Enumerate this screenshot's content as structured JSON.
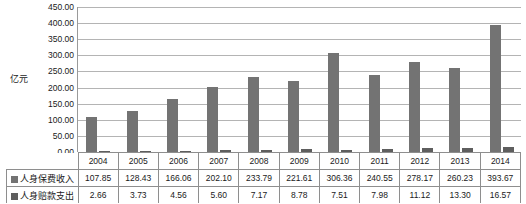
{
  "chart_data": {
    "type": "bar",
    "title": "",
    "xlabel": "",
    "ylabel": "亿元",
    "ylim": [
      0,
      450
    ],
    "ytick_step": 50,
    "ytick_labels": [
      "450.00",
      "400.00",
      "350.00",
      "300.00",
      "250.00",
      "200.00",
      "150.00",
      "100.00",
      "50.00",
      "0.00"
    ],
    "ytick_values": [
      450,
      400,
      350,
      300,
      250,
      200,
      150,
      100,
      50,
      0
    ],
    "grid": true,
    "legend_position": "table-left",
    "categories": [
      "2004",
      "2005",
      "2006",
      "2007",
      "2008",
      "2009",
      "2010",
      "2011",
      "2012",
      "2013",
      "2014"
    ],
    "series": [
      {
        "name": "人身保费收入",
        "color": "#737373",
        "values": [
          107.85,
          128.43,
          166.06,
          202.1,
          233.79,
          221.61,
          306.36,
          240.55,
          278.17,
          260.23,
          393.67
        ],
        "labels": [
          "107.85",
          "128.43",
          "166.06",
          "202.10",
          "233.79",
          "221.61",
          "306.36",
          "240.55",
          "278.17",
          "260.23",
          "393.67"
        ]
      },
      {
        "name": "人身赔款支出",
        "color": "#5e5e5e",
        "values": [
          2.66,
          3.73,
          4.56,
          5.6,
          7.17,
          8.78,
          7.51,
          7.98,
          11.12,
          13.3,
          16.57
        ],
        "labels": [
          "2.66",
          "3.73",
          "4.56",
          "5.60",
          "7.17",
          "8.78",
          "7.51",
          "7.98",
          "11.12",
          "13.30",
          "16.57"
        ]
      }
    ]
  }
}
